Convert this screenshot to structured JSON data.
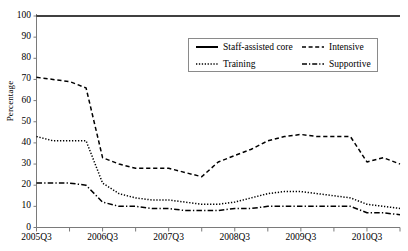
{
  "chart_data": {
    "type": "line",
    "title": "",
    "xlabel": "",
    "ylabel": "Percentage",
    "ylim": [
      0,
      100
    ],
    "ytick_values": [
      0,
      10,
      20,
      30,
      40,
      50,
      60,
      70,
      80,
      90,
      100
    ],
    "ytick_labels": [
      "0",
      "10",
      "20",
      "30",
      "40",
      "50",
      "60",
      "70",
      "80",
      "90",
      "100"
    ],
    "grid": false,
    "legend_position": "upper-center",
    "x": [
      "2005Q3",
      "2005Q4",
      "2006Q1",
      "2006Q2",
      "2006Q3",
      "2006Q4",
      "2007Q1",
      "2007Q2",
      "2007Q3",
      "2007Q4",
      "2008Q1",
      "2008Q2",
      "2008Q3",
      "2008Q4",
      "2009Q1",
      "2009Q2",
      "2009Q3",
      "2009Q4",
      "2010Q1",
      "2010Q2",
      "2010Q3",
      "2010Q4",
      "2011Q1"
    ],
    "xtick_labels": [
      "2005Q3",
      "2006Q3",
      "2007Q3",
      "2008Q3",
      "2009Q3",
      "2010Q3"
    ],
    "xtick_label_indices": [
      0,
      4,
      8,
      12,
      16,
      20
    ],
    "series": [
      {
        "name": "Staff-assisted core",
        "style": "solid",
        "color": "#000000",
        "values": [
          100,
          100,
          100,
          100,
          100,
          100,
          100,
          100,
          100,
          100,
          100,
          100,
          100,
          100,
          100,
          100,
          100,
          100,
          100,
          100,
          100,
          100,
          100
        ]
      },
      {
        "name": "Intensive",
        "style": "dashed",
        "color": "#000000",
        "values": [
          71,
          70,
          69,
          66,
          33,
          30,
          28,
          28,
          28,
          26,
          24,
          31,
          34,
          37,
          41,
          43,
          44,
          43,
          43,
          43,
          31,
          33,
          30
        ]
      },
      {
        "name": "Training",
        "style": "dotted",
        "color": "#000000",
        "values": [
          43,
          41,
          41,
          41,
          21,
          16,
          14,
          13,
          13,
          12,
          11,
          11,
          12,
          14,
          16,
          17,
          17,
          16,
          15,
          14,
          11,
          10,
          9
        ]
      },
      {
        "name": "Supportive",
        "style": "dashdot",
        "color": "#000000",
        "values": [
          21,
          21,
          21,
          20,
          12,
          10,
          10,
          9,
          9,
          8,
          8,
          8,
          9,
          9,
          10,
          10,
          10,
          10,
          10,
          10,
          7,
          7,
          6
        ]
      }
    ]
  },
  "legend": {
    "items": [
      {
        "label": "Staff-assisted core",
        "style": "solid"
      },
      {
        "label": "Intensive",
        "style": "dashed"
      },
      {
        "label": "Training",
        "style": "dotted"
      },
      {
        "label": "Supportive",
        "style": "dashdot"
      }
    ]
  }
}
